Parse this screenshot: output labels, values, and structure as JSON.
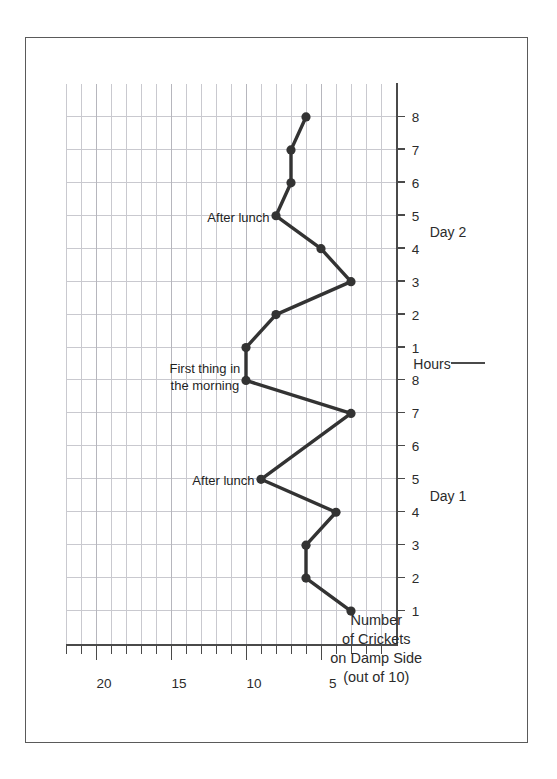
{
  "chart_data": {
    "type": "line",
    "title": "",
    "xlabel": "Hours",
    "ylabel": "Number of Crickets on Damp Side (out of 10)",
    "ylim": [
      0,
      22
    ],
    "ytick_values": [
      5,
      10,
      15,
      20
    ],
    "ytick_labels": [
      "5",
      "10",
      "15",
      "20"
    ],
    "yminor_step": 1,
    "grid": true,
    "legend": "none",
    "orientation": "rotated-90-ccw",
    "x_groups": [
      {
        "label": "Day 1",
        "ticks": [
          "1",
          "2",
          "3",
          "4",
          "5",
          "6",
          "7",
          "8"
        ]
      },
      {
        "label": "Day 2",
        "ticks": [
          "1",
          "2",
          "3",
          "4",
          "5",
          "6",
          "7",
          "8"
        ]
      }
    ],
    "x": [
      1,
      2,
      3,
      4,
      5,
      6,
      7,
      8,
      9,
      10,
      11,
      12,
      13,
      14,
      15,
      16
    ],
    "xtick_labels": [
      "1",
      "2",
      "3",
      "4",
      "5",
      "6",
      "7",
      "8",
      "1",
      "2",
      "3",
      "4",
      "5",
      "6",
      "7",
      "8"
    ],
    "series": [
      {
        "name": "Number of Crickets on Damp Side",
        "values": [
          3,
          6,
          6,
          4,
          9,
          null,
          3,
          10,
          10,
          8,
          3,
          5,
          8,
          7,
          7,
          6
        ],
        "marker": "circle",
        "color": "#333333"
      }
    ],
    "annotations": [
      {
        "text": "After lunch",
        "x_index": 5,
        "value": 9,
        "day": "Day 1",
        "hour": 5
      },
      {
        "text": "First thing in\nthe morning",
        "x_index": 9,
        "value": 10,
        "day": "Day 2",
        "hour": 1
      },
      {
        "text": "After lunch",
        "x_index": 13,
        "value": 8,
        "day": "Day 2",
        "hour": 5
      }
    ],
    "colors": {
      "line": "#333333",
      "marker": "#333333",
      "axis": "#4a4a4a",
      "grid": "#c9c9cf",
      "frame": "#5a5a5a",
      "text": "#2b2b2b",
      "background": "#ffffff"
    }
  },
  "axis": {
    "y_title_lines": [
      "Number",
      "of Crickets",
      "on Damp Side",
      "(out of 10)"
    ],
    "x_title": "Hours"
  },
  "annotations": {
    "after_lunch_day1": "After lunch",
    "first_thing_morning": "First thing in\nthe morning",
    "first_thing_morning_line1": "First thing in",
    "first_thing_morning_line2": "the morning",
    "after_lunch_day2": "After lunch"
  },
  "day_labels": {
    "day1": "Day 1",
    "day2": "Day 2"
  }
}
